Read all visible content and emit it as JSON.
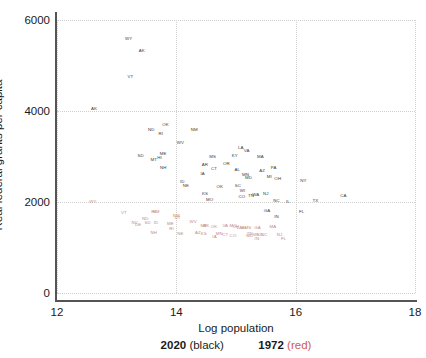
{
  "chart_data": {
    "type": "scatter",
    "title": "",
    "xlabel": "Log population",
    "ylabel": "Real federal grants per capita",
    "xlim": [
      12,
      18
    ],
    "ylim": [
      0,
      6000
    ],
    "xticks": [
      12,
      14,
      16,
      18
    ],
    "yticks": [
      0,
      2000,
      4000,
      6000
    ],
    "grid": true,
    "point_marker": "state-abbreviation-text",
    "legend": {
      "position": "below-axis",
      "entries": [
        {
          "name": "2020",
          "paren": "(black)",
          "color": "#1a1a1a"
        },
        {
          "name": "1972",
          "paren": "(red)",
          "color": "#d05a52"
        }
      ]
    },
    "series": [
      {
        "name": "2020",
        "color": "#3b3b3b",
        "points": [
          {
            "label": "WY",
            "x": 13.2,
            "y": 5580
          },
          {
            "label": "AK",
            "x": 13.42,
            "y": 5320
          },
          {
            "label": "VT",
            "x": 13.23,
            "y": 4740
          },
          {
            "label": "AK",
            "x": 12.62,
            "y": 4040
          },
          {
            "label": "OK",
            "x": 13.82,
            "y": 3700
          },
          {
            "label": "ND",
            "x": 13.58,
            "y": 3590
          },
          {
            "label": "RI",
            "x": 13.74,
            "y": 3500
          },
          {
            "label": "NM",
            "x": 14.3,
            "y": 3590
          },
          {
            "label": "WV",
            "x": 14.07,
            "y": 3290
          },
          {
            "label": "SD",
            "x": 13.4,
            "y": 3020
          },
          {
            "label": "ME",
            "x": 13.78,
            "y": 3050
          },
          {
            "label": "MT",
            "x": 13.62,
            "y": 2930
          },
          {
            "label": "HI",
            "x": 13.72,
            "y": 2960
          },
          {
            "label": "NH",
            "x": 13.78,
            "y": 2740
          },
          {
            "label": "LA",
            "x": 15.08,
            "y": 3180
          },
          {
            "label": "VA",
            "x": 15.18,
            "y": 3130
          },
          {
            "label": "KY",
            "x": 14.98,
            "y": 3010
          },
          {
            "label": "MA",
            "x": 15.41,
            "y": 2990
          },
          {
            "label": "MS",
            "x": 14.61,
            "y": 2990
          },
          {
            "label": "AR",
            "x": 14.48,
            "y": 2820
          },
          {
            "label": "OR",
            "x": 14.84,
            "y": 2840
          },
          {
            "label": "CT",
            "x": 14.63,
            "y": 2720
          },
          {
            "label": "IA",
            "x": 14.44,
            "y": 2620
          },
          {
            "label": "AL",
            "x": 15.02,
            "y": 2710
          },
          {
            "label": "PA",
            "x": 15.63,
            "y": 2750
          },
          {
            "label": "AZ",
            "x": 15.44,
            "y": 2690
          },
          {
            "label": "MI",
            "x": 15.56,
            "y": 2540
          },
          {
            "label": "OH",
            "x": 15.7,
            "y": 2510
          },
          {
            "label": "MN",
            "x": 15.16,
            "y": 2600
          },
          {
            "label": "MD",
            "x": 15.21,
            "y": 2530
          },
          {
            "label": "ID",
            "x": 14.1,
            "y": 2430
          },
          {
            "label": "NE",
            "x": 14.16,
            "y": 2350
          },
          {
            "label": "OK",
            "x": 14.73,
            "y": 2340
          },
          {
            "label": "SC",
            "x": 15.03,
            "y": 2350
          },
          {
            "label": "WI",
            "x": 15.11,
            "y": 2250
          },
          {
            "label": "NJ",
            "x": 15.5,
            "y": 2170
          },
          {
            "label": "KS",
            "x": 14.48,
            "y": 2170
          },
          {
            "label": "CO",
            "x": 15.1,
            "y": 2100
          },
          {
            "label": "TN",
            "x": 15.25,
            "y": 2140
          },
          {
            "label": "WA",
            "x": 15.33,
            "y": 2150
          },
          {
            "label": "MO",
            "x": 14.56,
            "y": 2050
          },
          {
            "label": "NY",
            "x": 16.13,
            "y": 2460
          },
          {
            "label": "CA",
            "x": 16.8,
            "y": 2130
          },
          {
            "label": "TX",
            "x": 16.33,
            "y": 2020
          },
          {
            "label": "NC",
            "x": 15.68,
            "y": 2030
          },
          {
            "label": "IL",
            "x": 15.87,
            "y": 2010
          },
          {
            "label": "GA",
            "x": 15.52,
            "y": 1810
          },
          {
            "label": "FL",
            "x": 16.1,
            "y": 1770
          },
          {
            "label": "IN",
            "x": 15.68,
            "y": 1660
          }
        ]
      },
      {
        "name": "1972",
        "color": "#c08a85",
        "points": [
          {
            "label": "WY",
            "x": 12.6,
            "y": 1990
          },
          {
            "label": "VT",
            "x": 13.12,
            "y": 1760
          },
          {
            "label": "HI",
            "x": 13.62,
            "y": 1780
          },
          {
            "label": "NM",
            "x": 13.66,
            "y": 1790
          },
          {
            "label": "NM",
            "x": 14.0,
            "y": 1700
          },
          {
            "label": "UT",
            "x": 14.02,
            "y": 1640
          },
          {
            "label": "ND",
            "x": 13.48,
            "y": 1620
          },
          {
            "label": "NV",
            "x": 13.3,
            "y": 1530
          },
          {
            "label": "DE",
            "x": 13.36,
            "y": 1490
          },
          {
            "label": "SD",
            "x": 13.52,
            "y": 1530
          },
          {
            "label": "ID",
            "x": 13.66,
            "y": 1540
          },
          {
            "label": "ME",
            "x": 13.9,
            "y": 1520
          },
          {
            "label": "RI",
            "x": 13.92,
            "y": 1410
          },
          {
            "label": "NH",
            "x": 13.62,
            "y": 1320
          },
          {
            "label": "WV",
            "x": 14.28,
            "y": 1560
          },
          {
            "label": "MT",
            "x": 14.46,
            "y": 1480
          },
          {
            "label": "AK",
            "x": 14.5,
            "y": 1470
          },
          {
            "label": "OK",
            "x": 14.63,
            "y": 1450
          },
          {
            "label": "VA",
            "x": 14.82,
            "y": 1480
          },
          {
            "label": "LA",
            "x": 15.06,
            "y": 1430
          },
          {
            "label": "AL",
            "x": 15.14,
            "y": 1430
          },
          {
            "label": "MS",
            "x": 15.2,
            "y": 1430
          },
          {
            "label": "GA",
            "x": 15.36,
            "y": 1420
          },
          {
            "label": "MA",
            "x": 15.62,
            "y": 1460
          },
          {
            "label": "NE",
            "x": 14.07,
            "y": 1300
          },
          {
            "label": "AZ",
            "x": 14.36,
            "y": 1310
          },
          {
            "label": "KS",
            "x": 14.46,
            "y": 1290
          },
          {
            "label": "MN",
            "x": 14.72,
            "y": 1290
          },
          {
            "label": "CT",
            "x": 14.82,
            "y": 1280
          },
          {
            "label": "TN",
            "x": 15.23,
            "y": 1300
          },
          {
            "label": "MD",
            "x": 15.23,
            "y": 1250
          },
          {
            "label": "WI",
            "x": 15.33,
            "y": 1280
          },
          {
            "label": "SC",
            "x": 15.4,
            "y": 1270
          },
          {
            "label": "NC",
            "x": 15.47,
            "y": 1270
          },
          {
            "label": "IN",
            "x": 15.35,
            "y": 1180
          },
          {
            "label": "NJ",
            "x": 15.73,
            "y": 1280
          },
          {
            "label": "FL",
            "x": 15.8,
            "y": 1190
          },
          {
            "label": "MO",
            "x": 14.95,
            "y": 1470
          },
          {
            "label": "OH",
            "x": 15.0,
            "y": 1450
          },
          {
            "label": "CO",
            "x": 14.95,
            "y": 1250
          },
          {
            "label": "IA",
            "x": 14.64,
            "y": 1230
          }
        ]
      }
    ]
  }
}
